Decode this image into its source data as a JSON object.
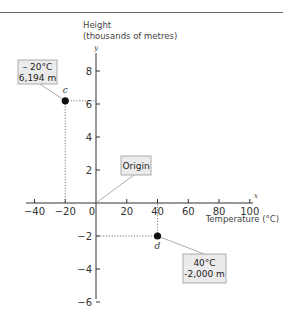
{
  "chart_data": {
    "type": "scatter",
    "title": "",
    "xlabel": "Temperature (°C)",
    "ylabel": "Height (thousands of metres)",
    "ylabel_lines": [
      "Height",
      "(thousands of metres)"
    ],
    "x_axis_letter": "x",
    "y_axis_letter": "y",
    "xlim": [
      -40,
      100
    ],
    "ylim": [
      -6,
      8
    ],
    "x_ticks": [
      -40,
      -20,
      0,
      20,
      40,
      60,
      80,
      100
    ],
    "x_tick_labels": [
      "−40",
      "−20",
      "0",
      "20",
      "40",
      "60",
      "80",
      "100"
    ],
    "y_ticks": [
      -6,
      -4,
      -2,
      2,
      4,
      6,
      8
    ],
    "y_tick_labels": [
      "−6",
      "−4",
      "−2",
      "2",
      "4",
      "6",
      "8"
    ],
    "grid": false,
    "points": [
      {
        "name": "c",
        "x": -20,
        "y": 6.194,
        "label_lines": [
          "– 20°C",
          "6,194 m"
        ]
      },
      {
        "name": "d",
        "x": 40,
        "y": -2,
        "label_lines": [
          "40°C",
          "-2,000 m"
        ]
      }
    ],
    "annotations": [
      {
        "text": "Origin",
        "x": 0,
        "y": 0
      }
    ]
  },
  "colors": {
    "axis": "#333333",
    "point": "#111111",
    "box_fill": "#ebebeb",
    "box_stroke": "#9a9a9a",
    "leader": "#999999",
    "rule": "#6e6e6e"
  }
}
